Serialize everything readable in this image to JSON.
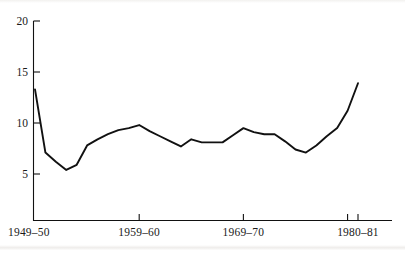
{
  "chart_data": {
    "type": "line",
    "title": "",
    "xlabel": "",
    "ylabel": "",
    "grid": false,
    "legend": null,
    "ylim": [
      0,
      20
    ],
    "yticks": [
      5,
      10,
      15,
      20
    ],
    "ytick_labels": [
      "5",
      "10",
      "15",
      "20"
    ],
    "xtick_labels": [
      "1949–50",
      "1959–60",
      "1969–70",
      "1980–81"
    ],
    "xtick_positions": [
      0,
      10,
      20,
      31
    ],
    "x_axis_extra_tick_position": 30,
    "categories": [
      "1949-50",
      "1950-51",
      "1951-52",
      "1952-53",
      "1953-54",
      "1954-55",
      "1955-56",
      "1956-57",
      "1957-58",
      "1958-59",
      "1959-60",
      "1960-61",
      "1961-62",
      "1962-63",
      "1963-64",
      "1964-65",
      "1965-66",
      "1966-67",
      "1967-68",
      "1968-69",
      "1969-70",
      "1970-71",
      "1971-72",
      "1972-73",
      "1973-74",
      "1974-75",
      "1975-76",
      "1976-77",
      "1977-78",
      "1978-79",
      "1979-80",
      "1980-81"
    ],
    "values": [
      13.3,
      7.1,
      6.2,
      5.4,
      5.9,
      7.8,
      8.4,
      8.9,
      9.3,
      9.5,
      9.8,
      9.2,
      8.7,
      8.2,
      7.7,
      8.4,
      8.1,
      8.1,
      8.1,
      8.8,
      9.5,
      9.1,
      8.9,
      8.9,
      8.2,
      7.4,
      7.1,
      7.8,
      8.7,
      9.5,
      11.2,
      13.9
    ],
    "series": [
      {
        "name": "series-1",
        "color": "#111111",
        "values": [
          13.3,
          7.1,
          6.2,
          5.4,
          5.9,
          7.8,
          8.4,
          8.9,
          9.3,
          9.5,
          9.8,
          9.2,
          8.7,
          8.2,
          7.7,
          8.4,
          8.1,
          8.1,
          8.1,
          8.8,
          9.5,
          9.1,
          8.9,
          8.9,
          8.2,
          7.4,
          7.1,
          7.8,
          8.7,
          9.5,
          11.2,
          13.9
        ]
      }
    ]
  },
  "axes": {
    "y_axis_name": "y-axis",
    "x_axis_name": "x-axis"
  }
}
